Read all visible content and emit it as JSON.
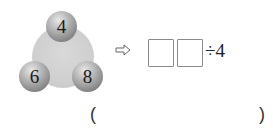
{
  "figure": {
    "balls": [
      {
        "position": "top",
        "value": "4"
      },
      {
        "position": "bottom-left",
        "value": "6"
      },
      {
        "position": "bottom-right",
        "value": "8"
      }
    ],
    "arrow_icon": "hollow-right-arrow",
    "expression": {
      "blank_boxes": 2,
      "operator_and_divisor": "÷4"
    }
  },
  "answer": {
    "open_paren": "(",
    "close_paren": ")"
  }
}
